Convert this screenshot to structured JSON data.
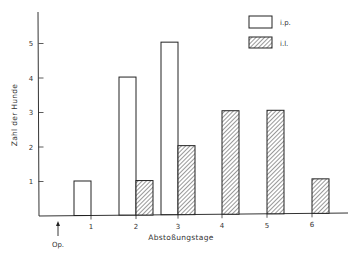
{
  "chart_data": {
    "type": "bar",
    "title": "",
    "xlabel": "Abstoßungstage",
    "ylabel": "Zahl der Hunde",
    "categories": [
      "1",
      "2",
      "3",
      "4",
      "5",
      "6"
    ],
    "series": [
      {
        "name": "i.p.",
        "pattern": "open",
        "values": [
          1,
          4,
          5,
          0,
          0,
          0
        ]
      },
      {
        "name": "i.l.",
        "pattern": "hatched",
        "values": [
          0,
          1,
          2,
          3,
          3,
          1
        ]
      }
    ],
    "ylim": [
      0,
      5.8
    ],
    "yticks": [
      1,
      2,
      3,
      4,
      5
    ],
    "grid": false,
    "legend_position": "top-right",
    "annotations": [
      {
        "text": "Op.",
        "type": "arrow",
        "position": "x-axis before day 1"
      }
    ]
  },
  "labels": {
    "op_marker": "Op."
  },
  "colors": {
    "ink": "#222222",
    "background": "#ffffff",
    "hatch": "#444444"
  }
}
